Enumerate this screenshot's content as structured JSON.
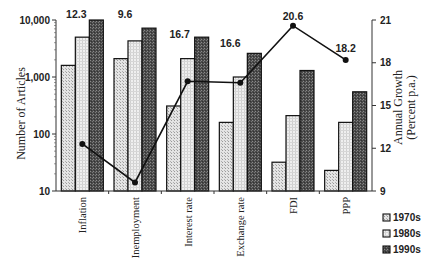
{
  "chart_data": {
    "type": "bar",
    "categories": [
      "Inflation",
      "Unemployment",
      "Interest rate",
      "Exchange rate",
      "FDI",
      "PPP"
    ],
    "category_labels_displayed": [
      "Inflation",
      "Inemployment",
      "Interest rate",
      "Exchange rate",
      "FDI",
      "PPP"
    ],
    "series": [
      {
        "name": "1970s",
        "values": [
          1600,
          2100,
          310,
          160,
          32,
          23
        ],
        "color": "#d9d9d9",
        "pattern": "light-dots"
      },
      {
        "name": "1980s",
        "values": [
          5000,
          4300,
          2100,
          1000,
          210,
          160
        ],
        "color": "#e6e6e6",
        "pattern": "light-grid"
      },
      {
        "name": "1990s",
        "values": [
          10000,
          7200,
          5000,
          2600,
          1300,
          550
        ],
        "color": "#555555",
        "pattern": "dark-crosshatch"
      }
    ],
    "line_series": {
      "name": "Annual Growth",
      "axis": "right",
      "values": [
        12.3,
        9.6,
        16.7,
        16.6,
        20.6,
        18.2
      ],
      "labels": [
        "12.3",
        "9.6",
        "16.7",
        "16.6",
        "20.6",
        "18.2"
      ]
    },
    "ylabel": "Number of Articles",
    "ylabel_right": "Annual Growth (Percent p.a.)",
    "ylabel_right_lines": [
      "Annual Growth",
      "(Percent p.a.)"
    ],
    "yscale": "log",
    "ylim": [
      10,
      10000
    ],
    "yticks": [
      10,
      100,
      1000,
      10000
    ],
    "ytick_labels": [
      "10",
      "100",
      "1,000",
      "10,000"
    ],
    "ylim_right": [
      9,
      21
    ],
    "yticks_right": [
      9,
      12,
      15,
      18,
      21
    ],
    "ytick_labels_right": [
      "9",
      "12",
      "15",
      "18",
      "21"
    ],
    "legend": {
      "position": "bottom-right",
      "entries": [
        "1970s",
        "1980s",
        "1990s"
      ]
    },
    "grid": false,
    "title": ""
  }
}
